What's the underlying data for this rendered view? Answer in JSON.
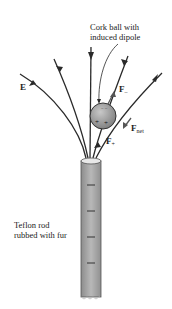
{
  "diagram": {
    "labels": {
      "cork_ball_line1": "Cork ball with",
      "cork_ball_line2": "induced dipole",
      "field": "E",
      "force_minus": "F",
      "force_minus_sub": "–",
      "force_plus": "F",
      "force_plus_sub": "+",
      "force_net": "F",
      "force_net_sub": "net",
      "rod_line1": "Teflon rod",
      "rod_line2": "rubbed with fur"
    },
    "ball_charges": {
      "top": "– –",
      "bottom_left": "+",
      "bottom_right": "+"
    },
    "colors": {
      "line": "#2a2a2a",
      "rod": "#a8a8a8",
      "ball": "#9a9a9a",
      "text": "#222222"
    }
  }
}
